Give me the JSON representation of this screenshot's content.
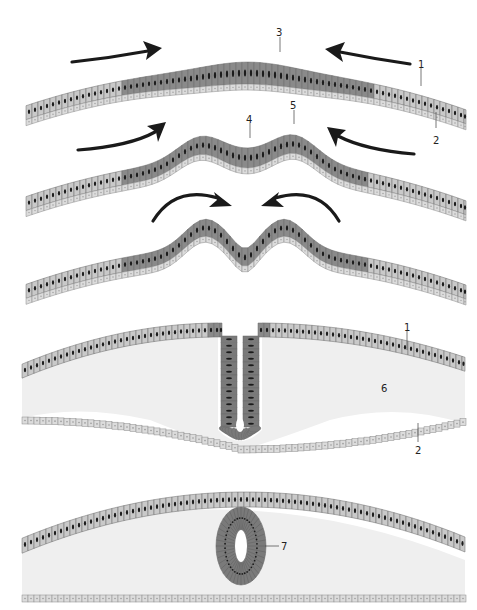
{
  "diagram": {
    "colors": {
      "ectoderm_cell": "#c9c9c9",
      "neural_plate_cell": "#8a8a8a",
      "neural_tube_cell": "#7a7a7a",
      "basal_layer_cell": "#dcdcdc",
      "nucleus": "#1b1b1b",
      "cell_outline": "#6a6a6a",
      "mesenchyme_fill": "#efefef",
      "arrow": "#1a1a1a",
      "background": "#ffffff"
    },
    "stages": [
      {
        "id": "stage-1",
        "description": "Neural plate thickening",
        "arrows": "inward-straight",
        "labels": [
          {
            "text": "3",
            "refers_to": "neural-plate"
          },
          {
            "text": "1",
            "refers_to": "ectoderm"
          },
          {
            "text": "2",
            "refers_to": "basal-layer"
          }
        ]
      },
      {
        "id": "stage-2",
        "description": "Neural folds rise, neural groove forms",
        "arrows": "inward-curved",
        "labels": [
          {
            "text": "4",
            "refers_to": "neural-groove"
          },
          {
            "text": "5",
            "refers_to": "neural-fold"
          }
        ]
      },
      {
        "id": "stage-3",
        "description": "Neural folds converge",
        "arrows": "inward-arched",
        "labels": []
      },
      {
        "id": "stage-4",
        "description": "Neural folds fuse, tube closes",
        "arrows": "none",
        "labels": [
          {
            "text": "1",
            "refers_to": "ectoderm"
          },
          {
            "text": "6",
            "refers_to": "mesenchyme"
          },
          {
            "text": "2",
            "refers_to": "basal-layer"
          }
        ]
      },
      {
        "id": "stage-5",
        "description": "Neural tube detached beneath ectoderm",
        "arrows": "none",
        "labels": [
          {
            "text": "7",
            "refers_to": "neural-tube"
          }
        ]
      }
    ]
  }
}
